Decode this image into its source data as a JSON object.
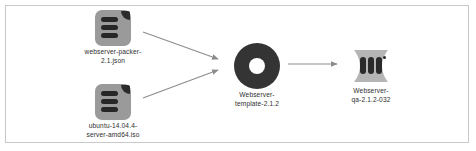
{
  "diagram": {
    "background_color": "#ffffff",
    "border_color": "#c9c9c9",
    "nodes": [
      {
        "id": "packer-json",
        "icon": "file-document-icon",
        "label_line1": "webserver-packer-",
        "label_line2": "2.1.json",
        "icon_color": "#9a9a9a",
        "detail_color": "#262626"
      },
      {
        "id": "ubuntu-iso",
        "icon": "file-document-icon",
        "label_line1": "ubuntu-14.04.4-",
        "label_line2": "server-amd64.iso",
        "icon_color": "#9a9a9a",
        "detail_color": "#262626"
      },
      {
        "id": "template",
        "icon": "disc-icon",
        "label_line1": "Webserver-",
        "label_line2": "template-2.1.2",
        "icon_color": "#343434",
        "detail_color": "#ffffff"
      },
      {
        "id": "qa-vm",
        "icon": "server-vm-icon",
        "label_line1": "Webserver-",
        "label_line2": "qa-2.1.2-032",
        "icon_color": "#b5b5b5",
        "detail_color": "#2a2a2a"
      }
    ],
    "edges": [
      {
        "id": "edge-packer-to-template",
        "from": "packer-json",
        "to": "template",
        "style": "arrow",
        "color": "#8c8c8c"
      },
      {
        "id": "edge-iso-to-template",
        "from": "ubuntu-iso",
        "to": "template",
        "style": "arrow",
        "color": "#8c8c8c"
      },
      {
        "id": "edge-template-to-qa",
        "from": "template",
        "to": "qa-vm",
        "style": "arrow",
        "color": "#8c8c8c"
      }
    ]
  }
}
